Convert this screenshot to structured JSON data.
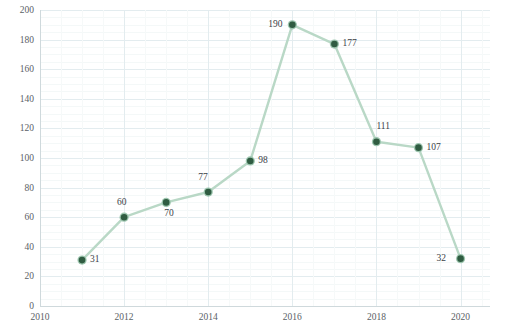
{
  "chart_data": {
    "type": "line",
    "title": "",
    "xlabel": "",
    "ylabel": "NUMBER",
    "xlim": [
      2010,
      2020.7
    ],
    "ylim": [
      0,
      200
    ],
    "grid": true,
    "legend": "none",
    "x": [
      2011,
      2012,
      2013,
      2014,
      2015,
      2016,
      2017,
      2018,
      2019,
      2020
    ],
    "values": [
      31,
      60,
      70,
      77,
      98,
      190,
      177,
      111,
      107,
      32
    ],
    "point_labels": [
      "31",
      "60",
      "70",
      "77",
      "98",
      "190",
      "177",
      "111",
      "107",
      "32"
    ],
    "label_positions": [
      "right",
      "above",
      "below-right",
      "above-left",
      "right",
      "left",
      "right",
      "above-right",
      "right",
      "left"
    ],
    "xticks": [
      "2010",
      "2012",
      "2014",
      "2016",
      "2018",
      "2020"
    ],
    "xtick_values": [
      2010,
      2012,
      2014,
      2016,
      2018,
      2020
    ],
    "yticks": [
      "0",
      "20",
      "40",
      "60",
      "80",
      "100",
      "120",
      "140",
      "160",
      "180",
      "200"
    ],
    "ytick_values": [
      0,
      20,
      40,
      60,
      80,
      100,
      120,
      140,
      160,
      180,
      200
    ],
    "colors": {
      "line": "#b9d8c6",
      "marker_fill": "#2f5c41",
      "marker_halo": "#9cc5ae",
      "grid_major": "#e3ecef",
      "grid_minor": "#f4f8f8",
      "axis": "#cfd9dc",
      "tick_text": "#5a6166",
      "data_label_text": "#3c4247",
      "background": "#ffffff"
    }
  }
}
